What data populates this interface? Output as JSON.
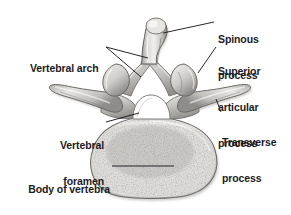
{
  "figure": {
    "view": "superior (axial) view of a lumbar vertebra",
    "background_color": "#ffffff",
    "ink_color": "#1b1b1f",
    "bone_light": "#f2f1ef",
    "bone_mid": "#c9c7c4",
    "bone_dark": "#9b9996",
    "bone_shadow": "#6f6e6c",
    "foramen_fill": "#ffffff",
    "trabecular_speckle": "#8d8b88"
  },
  "labels": [
    {
      "id": "spinous-process",
      "text_lines": [
        "Spinous",
        "process"
      ],
      "x": 218,
      "y": 10,
      "align": "left",
      "leader": {
        "from_x": 214,
        "from_y": 22,
        "to_x": 163,
        "to_y": 33
      }
    },
    {
      "id": "superior-articular-process",
      "text_lines": [
        "Superior",
        "articular",
        "process"
      ],
      "x": 218,
      "y": 43,
      "align": "left",
      "leader": {
        "from_x": 216,
        "from_y": 47,
        "to_x": 198,
        "to_y": 73
      }
    },
    {
      "id": "transverse-process",
      "text_lines": [
        "Transverse",
        "process"
      ],
      "x": 222,
      "y": 114,
      "align": "left",
      "leader": {
        "from_x": 221,
        "from_y": 112,
        "to_x": 216,
        "to_y": 99
      }
    },
    {
      "id": "vertebral-arch",
      "text_lines": [
        "Vertebral arch"
      ],
      "x": 30,
      "y": 40,
      "align": "left",
      "leader": {
        "from_x": 106,
        "from_y": 47,
        "to_x": 146,
        "to_y": 58
      },
      "leader2": {
        "from_x": 106,
        "from_y": 47,
        "to_x": 140,
        "to_y": 76
      }
    },
    {
      "id": "vertebral-foramen",
      "text_lines": [
        "Vertebral",
        "foramen"
      ],
      "x": 104,
      "y": 117,
      "align": "right",
      "leader": {
        "from_x": 106,
        "from_y": 122,
        "to_x": 137,
        "to_y": 113
      }
    },
    {
      "id": "body-of-vertebra",
      "text_lines": [
        "Body of vertebra"
      ],
      "x": 110,
      "y": 161,
      "align": "right",
      "leader": {
        "from_x": 112,
        "from_y": 166,
        "to_x": 172,
        "to_y": 166
      }
    }
  ],
  "structures": [
    {
      "id": "spinous-process",
      "name": "Spinous process"
    },
    {
      "id": "superior-articular-process",
      "name": "Superior articular process"
    },
    {
      "id": "transverse-process-left",
      "name": "Transverse process (left)"
    },
    {
      "id": "transverse-process-right",
      "name": "Transverse process (right)"
    },
    {
      "id": "vertebral-arch",
      "name": "Vertebral arch"
    },
    {
      "id": "vertebral-foramen",
      "name": "Vertebral foramen"
    },
    {
      "id": "vertebral-body",
      "name": "Body of vertebra"
    }
  ]
}
